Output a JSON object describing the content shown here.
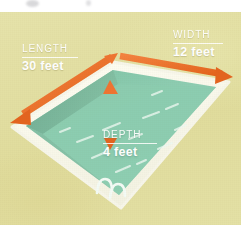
{
  "illustration": {
    "subject": "swimming-pool-dimensions-diagram",
    "colors": {
      "deck_background": "#e3e0a4",
      "pool_coping": "#ffffff",
      "water_surface": "#86c9ac",
      "water_shadow_wall": "#7ab79d",
      "water_deep": "#93d0b4",
      "arrow_orange": "#ef7432",
      "arrow_orange_dark": "#e2641f",
      "label_text": "#ffffff",
      "page_background": "#ffffff"
    }
  },
  "labels": {
    "length": {
      "caption": "LENGTH",
      "value": "30 feet"
    },
    "width": {
      "caption": "WIDTH",
      "value": "12 feet"
    },
    "depth": {
      "caption": "DEPTH",
      "value": "4 feet"
    }
  },
  "arrows": {
    "length_arrow": "double-headed-arrow-along-long-side",
    "width_arrow": "double-headed-arrow-along-short-side",
    "depth_arrow": "vertical-arrow-in-pool"
  },
  "features": {
    "ladder": "pool-ladder",
    "water_highlights": "water-sparkle-lines"
  }
}
